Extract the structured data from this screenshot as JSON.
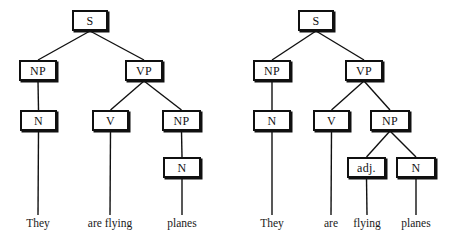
{
  "figure": {
    "background_color": "#ffffff",
    "line_color": "#101010",
    "text_color": "#1a1a1a",
    "width": 453,
    "height": 238
  },
  "trees": [
    {
      "id": "left",
      "reading": "They are flying planes.",
      "nodes": [
        {
          "id": "S",
          "label": "S",
          "x": 72,
          "y": 10,
          "w": 36,
          "h": 21
        },
        {
          "id": "NP1",
          "label": "NP",
          "x": 19,
          "y": 60,
          "w": 38,
          "h": 21
        },
        {
          "id": "VP",
          "label": "VP",
          "x": 125,
          "y": 60,
          "w": 38,
          "h": 21
        },
        {
          "id": "N1",
          "label": "N",
          "x": 20,
          "y": 110,
          "w": 37,
          "h": 21
        },
        {
          "id": "V",
          "label": "V",
          "x": 92,
          "y": 110,
          "w": 37,
          "h": 21
        },
        {
          "id": "NP2",
          "label": "NP",
          "x": 162,
          "y": 110,
          "w": 39,
          "h": 21
        },
        {
          "id": "N2",
          "label": "N",
          "x": 163,
          "y": 157,
          "w": 38,
          "h": 21
        }
      ],
      "edges": [
        {
          "from": "S",
          "to": "NP1"
        },
        {
          "from": "S",
          "to": "VP"
        },
        {
          "from": "NP1",
          "to": "N1"
        },
        {
          "from": "VP",
          "to": "V"
        },
        {
          "from": "VP",
          "to": "NP2"
        },
        {
          "from": "NP2",
          "to": "N2"
        },
        {
          "from": "N1",
          "to": "w-they"
        },
        {
          "from": "V",
          "to": "w-areflying"
        },
        {
          "from": "N2",
          "to": "w-planes"
        }
      ],
      "words": [
        {
          "id": "w-they",
          "text": "They",
          "x": 38,
          "y": 218
        },
        {
          "id": "w-areflying",
          "text": "are flying",
          "x": 110,
          "y": 218
        },
        {
          "id": "w-planes",
          "text": "planes",
          "x": 182,
          "y": 218
        }
      ]
    },
    {
      "id": "right",
      "reading": "They are flying planes.",
      "nodes": [
        {
          "id": "S",
          "label": "S",
          "x": 72,
          "y": 10,
          "w": 36,
          "h": 21
        },
        {
          "id": "NP1",
          "label": "NP",
          "x": 27,
          "y": 60,
          "w": 38,
          "h": 21
        },
        {
          "id": "VP",
          "label": "VP",
          "x": 119,
          "y": 60,
          "w": 38,
          "h": 21
        },
        {
          "id": "N1",
          "label": "N",
          "x": 27,
          "y": 110,
          "w": 38,
          "h": 21
        },
        {
          "id": "V",
          "label": "V",
          "x": 87,
          "y": 110,
          "w": 37,
          "h": 21
        },
        {
          "id": "NP2",
          "label": "NP",
          "x": 144,
          "y": 110,
          "w": 40,
          "h": 21
        },
        {
          "id": "ADJ",
          "label": "adj.",
          "x": 121,
          "y": 157,
          "w": 39,
          "h": 21
        },
        {
          "id": "N2",
          "label": "N",
          "x": 170,
          "y": 157,
          "w": 40,
          "h": 21
        }
      ],
      "edges": [
        {
          "from": "S",
          "to": "NP1"
        },
        {
          "from": "S",
          "to": "VP"
        },
        {
          "from": "NP1",
          "to": "N1"
        },
        {
          "from": "VP",
          "to": "V"
        },
        {
          "from": "VP",
          "to": "NP2"
        },
        {
          "from": "NP2",
          "to": "ADJ"
        },
        {
          "from": "NP2",
          "to": "N2"
        },
        {
          "from": "N1",
          "to": "w-they"
        },
        {
          "from": "V",
          "to": "w-are"
        },
        {
          "from": "ADJ",
          "to": "w-flying"
        },
        {
          "from": "N2",
          "to": "w-planes"
        }
      ],
      "words": [
        {
          "id": "w-they",
          "text": "They",
          "x": 46,
          "y": 218
        },
        {
          "id": "w-are",
          "text": "are",
          "x": 105,
          "y": 218
        },
        {
          "id": "w-flying",
          "text": "flying",
          "x": 141,
          "y": 218
        },
        {
          "id": "w-planes",
          "text": "planes",
          "x": 190,
          "y": 218
        }
      ]
    }
  ]
}
